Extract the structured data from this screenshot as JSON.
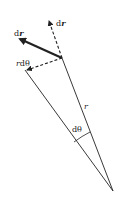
{
  "diagram": {
    "type": "polar-displacement",
    "labels": {
      "dr_vector": {
        "prefix": "d",
        "var": "r"
      },
      "dr_radial": {
        "prefix": "d",
        "var": "r"
      },
      "r_dtheta": {
        "var": "r",
        "rest": "dθ"
      },
      "r": "r",
      "dtheta": "dθ"
    },
    "colors": {
      "stroke": "#222222",
      "background": "#ffffff"
    }
  }
}
